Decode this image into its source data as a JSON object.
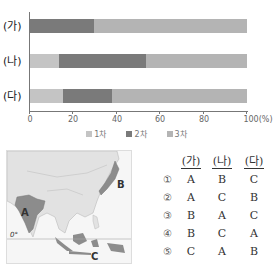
{
  "chart_data": {
    "type": "bar",
    "orientation": "horizontal",
    "stacked": true,
    "categories": [
      "(가)",
      "(나)",
      "(다)"
    ],
    "series": [
      {
        "name": "1차",
        "values": [
          0,
          13.5,
          15
        ],
        "color": "#c4c4c4"
      },
      {
        "name": "2차",
        "values": [
          29.5,
          40,
          23
        ],
        "color": "#7a7a7a"
      },
      {
        "name": "3차",
        "values": [
          70.5,
          46.5,
          62
        ],
        "color": "#b4b4b4"
      }
    ],
    "title": "",
    "xlabel": "(%)",
    "ylabel": "",
    "xlim": [
      0,
      100
    ],
    "xticks": [
      "0",
      "20",
      "40",
      "60",
      "80",
      "100(%)"
    ],
    "legend_position": "bottom",
    "grid": false
  },
  "chart": {
    "rows": [
      "(가)",
      "(나)",
      "(다)"
    ],
    "ticks": [
      "0",
      "20",
      "40",
      "60",
      "80",
      "100(%)"
    ],
    "legend": [
      "1차",
      "2차",
      "3차"
    ]
  },
  "map": {
    "labels": [
      "A",
      "B",
      "C"
    ],
    "equator_label": "0°"
  },
  "options": {
    "header": [
      "(가)",
      "(나)",
      "(다)"
    ],
    "rows": [
      {
        "num": "①",
        "ga": "A",
        "na": "B",
        "da": "C"
      },
      {
        "num": "②",
        "ga": "A",
        "na": "C",
        "da": "B"
      },
      {
        "num": "③",
        "ga": "B",
        "na": "A",
        "da": "C"
      },
      {
        "num": "④",
        "ga": "B",
        "na": "C",
        "da": "A"
      },
      {
        "num": "⑤",
        "ga": "C",
        "na": "A",
        "da": "B"
      }
    ]
  }
}
